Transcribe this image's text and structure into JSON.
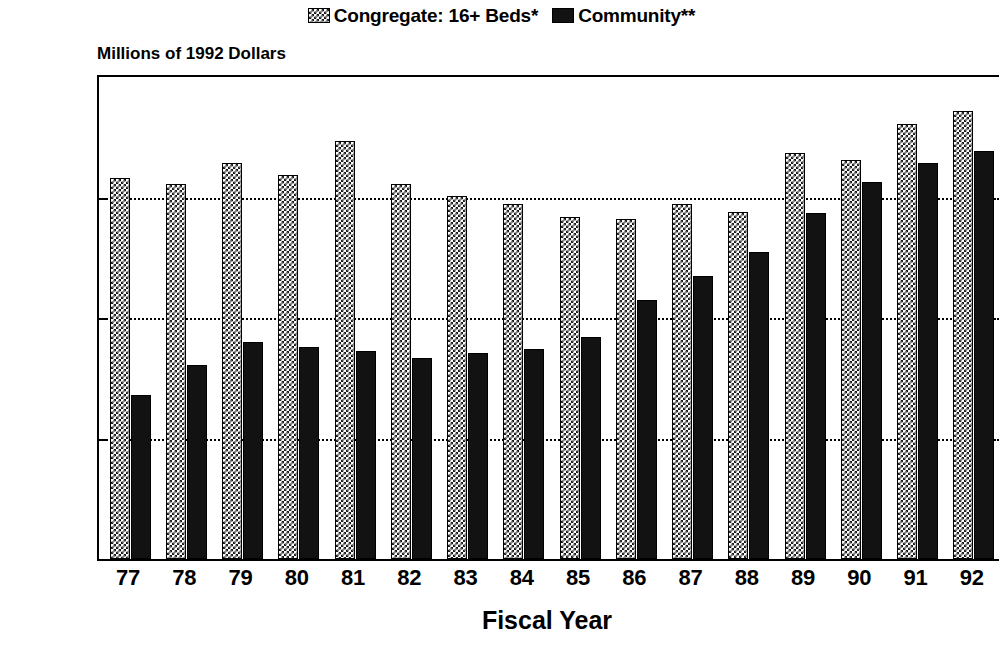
{
  "legend": {
    "position": "top-center",
    "entries": [
      {
        "label": "Congregate: 16+ Beds*",
        "swatch": "checkered-pattern-swatch",
        "color": "#1b1b1b"
      },
      {
        "label": "Community**",
        "swatch": "solid-dark-swatch",
        "color": "#121212"
      }
    ]
  },
  "axis": {
    "y_caption": "Millions of 1992 Dollars",
    "x_title": "Fiscal Year"
  },
  "chart_data": {
    "type": "bar",
    "title": "",
    "subtitle": "Millions of 1992 Dollars",
    "xlabel": "Fiscal Year",
    "ylabel": "Millions of 1992 Dollars",
    "ylim": [
      0,
      200
    ],
    "ytick_values": [
      0,
      50,
      100,
      150,
      200
    ],
    "ytick_labels": [
      "$0.0",
      "$50.0",
      "$100.0",
      "$150.0",
      "$200.0"
    ],
    "grid": "horizontal-dotted",
    "legend_position": "top-center",
    "categories": [
      "77",
      "78",
      "79",
      "80",
      "81",
      "82",
      "83",
      "84",
      "85",
      "86",
      "87",
      "88",
      "89",
      "90",
      "91",
      "92"
    ],
    "series": [
      {
        "name": "Congregate: 16+ Beds*",
        "values": [
          158.0,
          155.5,
          164.5,
          159.5,
          173.5,
          155.5,
          150.5,
          147.5,
          142.0,
          141.0,
          147.5,
          144.0,
          168.5,
          165.5,
          180.5,
          186.0
        ]
      },
      {
        "name": "Community**",
        "values": [
          68.0,
          80.5,
          90.0,
          88.0,
          86.5,
          83.5,
          85.5,
          87.0,
          92.0,
          107.5,
          117.5,
          127.5,
          143.5,
          156.5,
          164.5,
          169.5
        ]
      }
    ]
  }
}
